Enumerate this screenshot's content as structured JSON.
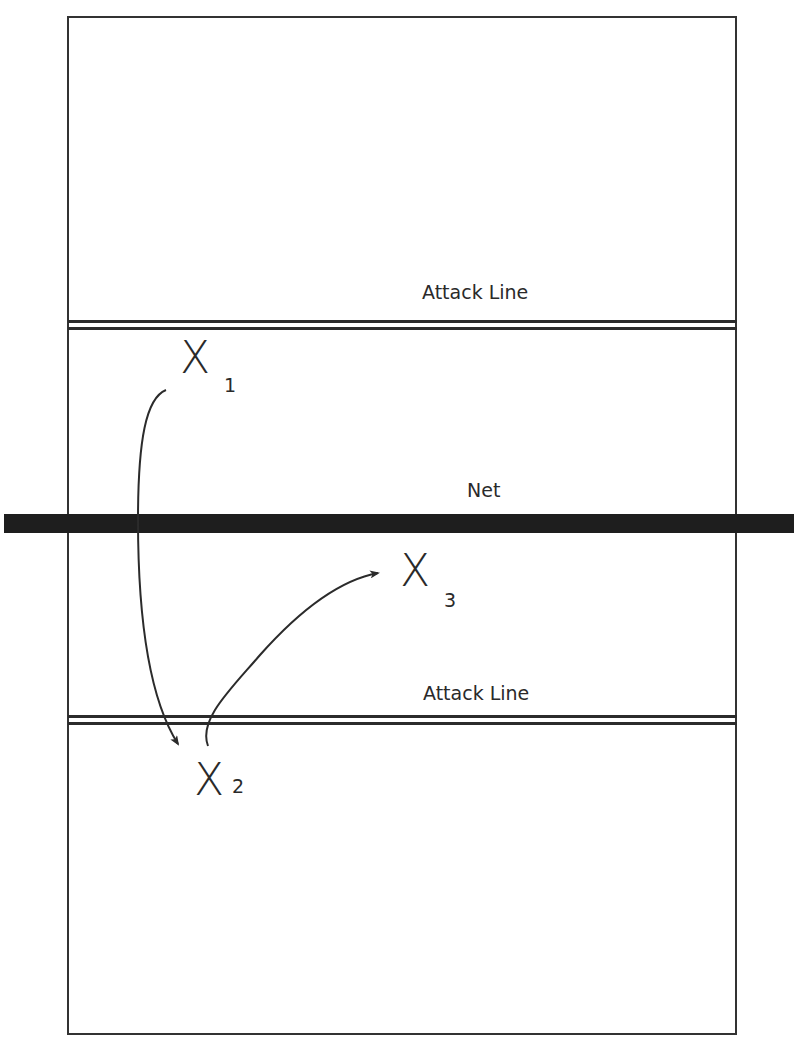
{
  "diagram": {
    "type": "volleyball-court-rotation",
    "labels": {
      "top_attack_line": "Attack Line",
      "net": "Net",
      "bottom_attack_line": "Attack Line"
    },
    "players": [
      {
        "mark": "X",
        "number": "1"
      },
      {
        "mark": "X",
        "number": "2"
      },
      {
        "mark": "X",
        "number": "3"
      }
    ],
    "movements": [
      {
        "from": "1",
        "to": "2"
      },
      {
        "from": "2",
        "to": "3"
      }
    ],
    "colors": {
      "line": "#2b2b2b",
      "net": "#1e1e1e",
      "background": "#ffffff"
    }
  }
}
